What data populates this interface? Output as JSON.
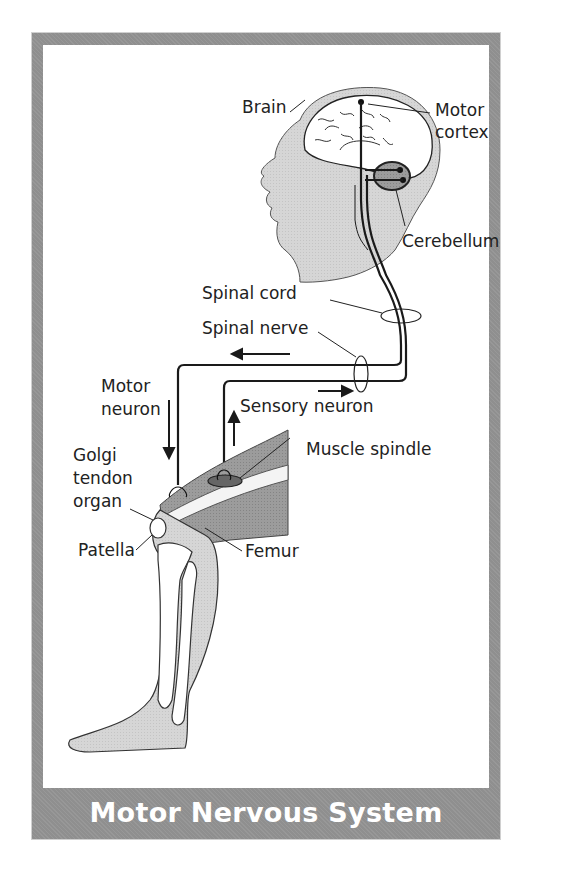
{
  "title": "Motor Nervous System",
  "labels": {
    "brain": "Brain",
    "motor_cortex_line1": "Motor",
    "motor_cortex_line2": "cortex",
    "cerebellum": "Cerebellum",
    "spinal_cord": "Spinal cord",
    "spinal_nerve": "Spinal nerve",
    "motor_neuron_line1": "Motor",
    "motor_neuron_line2": "neuron",
    "sensory_neuron": "Sensory neuron",
    "golgi_line1": "Golgi",
    "golgi_line2": "tendon",
    "golgi_line3": "organ",
    "muscle_spindle": "Muscle spindle",
    "patella": "Patella",
    "femur": "Femur"
  },
  "colors": {
    "frame": "#8f8f8f",
    "silhouette": "#d4d4d4",
    "muscle": "#9a9a9a",
    "line": "#1a1a1a"
  }
}
